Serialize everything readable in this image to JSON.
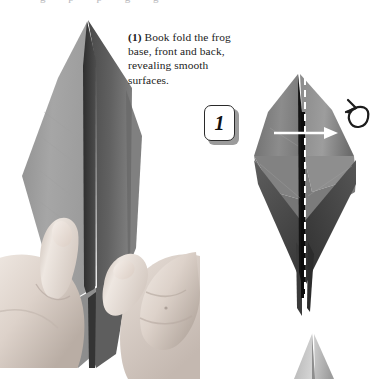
{
  "page": {
    "width": 373,
    "height": 379,
    "background": "#ffffff",
    "kind": "origami-instruction-step"
  },
  "top_bleed": {
    "text": "g p p g g",
    "note": "clipped descenders of a text line above the crop"
  },
  "caption": {
    "step_marker": "(1)",
    "step_number": "1",
    "text": " Book fold the frog base, front and back, revealing smooth surfaces.",
    "full_text": "(1) Book fold the frog base, front and back, revealing smooth surfaces.",
    "color": "#1b1b1b"
  },
  "step_badge": {
    "label": "1",
    "shape": "rounded-rectangle",
    "border_color": "#2a2a2a",
    "fill_color": "#ffffff",
    "shadow_color": "#9b9b9b"
  },
  "figures": {
    "left_photo": {
      "name": "hands-holding-frog-base",
      "description": "Grayscale photograph of two hands holding a tall pointed origami frog base, thumbs pinching the front layer",
      "tones": {
        "paper_light": "#a9a9a9",
        "paper_mid": "#8a8a8a",
        "paper_dark": "#5d5d5d",
        "paper_darkest": "#3c3c3c",
        "skin_light": "#efe9e4",
        "skin_mid": "#d8cfc8",
        "skin_shadow": "#b3a79f"
      }
    },
    "right_photo": {
      "name": "frog-base-diagram",
      "description": "Grayscale photograph of the frog base seen flat-on, a tall vertical diamond with a dark vertical center spine and pointed top and bottom",
      "tones": {
        "paper_light": "#969696",
        "paper_mid": "#7a7a7a",
        "paper_dark": "#5a5a5a",
        "spine": "#141414"
      }
    },
    "corner_photo": {
      "name": "next-step-model-tip",
      "description": "Small pale triangular tip of the following figure entering from the bottom-right corner",
      "tones": {
        "paper_light": "#d2d2d2",
        "paper_mid": "#b0b0b0",
        "paper_dark": "#8e8e8e"
      }
    }
  },
  "markings": {
    "fold_line": {
      "name": "valley-fold-dashed-line",
      "style": "dashed",
      "color": "#ffffff",
      "orientation": "vertical",
      "meaning": "fold along this line"
    },
    "fold_arrow": {
      "name": "book-fold-arrow",
      "color": "#ffffff",
      "direction": "right",
      "meaning": "swing the near layer to the right"
    },
    "turn_over_arrow": {
      "name": "turn-over-arrow",
      "color": "#1c1c1c",
      "meaning": "turn the model over and repeat behind"
    }
  }
}
